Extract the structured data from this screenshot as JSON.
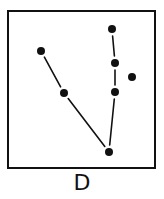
{
  "figure": {
    "label": "D",
    "frame": {
      "x": 8,
      "y": 11,
      "width": 147,
      "height": 157,
      "stroke": "#111111",
      "stroke_width": 2
    },
    "ink_color": "#111111",
    "points": [
      {
        "id": "p1",
        "x": 41,
        "y": 51
      },
      {
        "id": "p2",
        "x": 64,
        "y": 93
      },
      {
        "id": "p3",
        "x": 109,
        "y": 152
      },
      {
        "id": "p4",
        "x": 112,
        "y": 29
      },
      {
        "id": "p5",
        "x": 115,
        "y": 63
      },
      {
        "id": "p6",
        "x": 115,
        "y": 92
      },
      {
        "id": "p7",
        "x": 132,
        "y": 77
      }
    ],
    "edges": [
      [
        "p1",
        "p2"
      ],
      [
        "p2",
        "p3"
      ],
      [
        "p4",
        "p5"
      ],
      [
        "p5",
        "p6"
      ],
      [
        "p6",
        "p3"
      ]
    ],
    "point_radius": 4
  }
}
